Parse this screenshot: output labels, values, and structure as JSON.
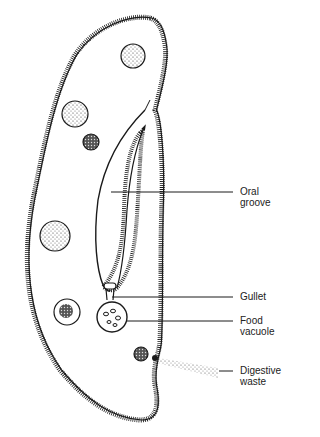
{
  "diagram": {
    "labels": [
      {
        "id": "oral-groove",
        "line1": "Oral",
        "line2": "groove"
      },
      {
        "id": "gullet",
        "line1": "Gullet",
        "line2": ""
      },
      {
        "id": "food-vacuole",
        "line1": "Food",
        "line2": "vacuole"
      },
      {
        "id": "digestive-waste",
        "line1": "Digestive",
        "line2": "waste"
      }
    ],
    "colors": {
      "ink": "#1a1a1a",
      "background": "#ffffff"
    }
  }
}
